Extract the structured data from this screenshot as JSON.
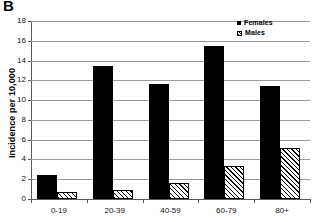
{
  "panel": {
    "letter": "B"
  },
  "chart_data": {
    "type": "bar",
    "title": "",
    "xlabel": "",
    "ylabel": "Incidence per 10,000",
    "categories": [
      "0-19",
      "20-39",
      "40-59",
      "60-79",
      "80+"
    ],
    "series": [
      {
        "name": "Females",
        "color": "#000000",
        "fill": "solid",
        "values": [
          2.4,
          13.5,
          11.6,
          15.5,
          11.45
        ]
      },
      {
        "name": "Males",
        "color": "#000000",
        "fill": "hatch-diagonal",
        "values": [
          0.7,
          0.9,
          1.6,
          3.3,
          5.2
        ]
      }
    ],
    "ylim": [
      0,
      18
    ],
    "yticks": [
      0,
      2,
      4,
      6,
      8,
      10,
      12,
      14,
      16,
      18
    ],
    "ytick_labels": [
      "0",
      "2",
      "4",
      "6",
      "8",
      "10",
      "12",
      "14",
      "16",
      "18"
    ],
    "grid": true,
    "grid_axis": "y",
    "legend": [
      "Females",
      "Males"
    ],
    "legend_position": "top-right"
  }
}
